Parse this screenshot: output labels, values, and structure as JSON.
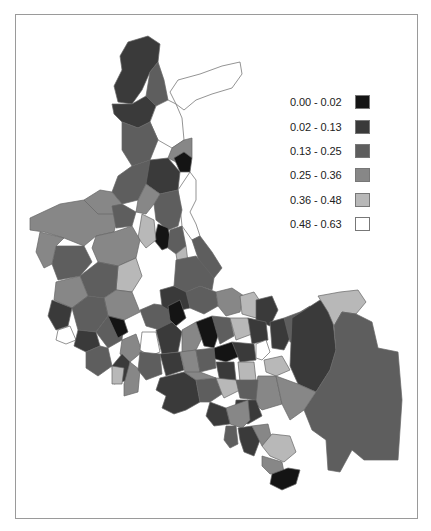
{
  "map": {
    "title": "",
    "stroke_color": "#666666",
    "classes": [
      {
        "label": "0.00 - 0.02",
        "color": "#141414"
      },
      {
        "label": "0.02 - 0.13",
        "color": "#3a3a3a"
      },
      {
        "label": "0.13 - 0.25",
        "color": "#5e5e5e"
      },
      {
        "label": "0.25 - 0.36",
        "color": "#878787"
      },
      {
        "label": "0.36 - 0.48",
        "color": "#b8b8b8"
      },
      {
        "label": "0.48 - 0.63",
        "color": "#ffffff"
      }
    ],
    "legend": {
      "position": "top-right",
      "items": [
        {
          "label": "0.00 - 0.02"
        },
        {
          "label": "0.02 - 0.13"
        },
        {
          "label": "0.13 - 0.25"
        },
        {
          "label": "0.25 - 0.36"
        },
        {
          "label": "0.36 - 0.48"
        },
        {
          "label": "0.48 - 0.63"
        }
      ]
    },
    "regions": [
      {
        "c": 1,
        "p": "128,42 148,36 160,44 158,62 150,72 142,90 132,104 118,102 114,86 122,70 120,56"
      },
      {
        "c": 2,
        "p": "150,72 158,62 164,80 168,100 156,106 146,96"
      },
      {
        "c": 5,
        "p": "170,92 178,80 200,74 222,66 240,62 242,74 232,88 212,94 196,100 184,110 176,104"
      },
      {
        "c": 1,
        "p": "112,104 132,104 146,96 156,106 150,122 138,128 122,122 114,114"
      },
      {
        "c": 5,
        "p": "150,122 156,106 168,100 176,104 182,118 184,140 172,148 158,140"
      },
      {
        "c": 2,
        "p": "122,122 138,128 150,122 158,140 150,160 132,166 122,150"
      },
      {
        "c": 3,
        "p": "172,148 184,140 192,138 192,158 180,164 168,158"
      },
      {
        "c": 0,
        "p": "174,158 184,152 192,158 190,172 180,172"
      },
      {
        "c": 1,
        "p": "150,160 168,158 180,172 178,190 160,194 146,184 140,170"
      },
      {
        "c": 2,
        "p": "132,166 150,160 146,184 138,200 122,204 112,192 118,176"
      },
      {
        "c": 5,
        "p": "190,172 196,180 196,200 190,212 196,224 200,236 192,240 182,226 180,206 178,190"
      },
      {
        "c": 2,
        "p": "160,194 178,190 182,210 178,226 168,230 156,220 154,204"
      },
      {
        "c": 3,
        "p": "146,184 160,194 154,204 146,214 136,212 138,200"
      },
      {
        "c": 0,
        "p": "158,224 168,228 172,246 162,250 154,240"
      },
      {
        "c": 4,
        "p": "142,214 154,220 156,240 146,248 138,238"
      },
      {
        "c": 2,
        "p": "170,230 182,226 186,246 176,254 168,248"
      },
      {
        "c": 4,
        "p": "176,254 186,246 188,262 178,266"
      },
      {
        "c": 2,
        "p": "192,240 200,236 212,252 222,268 214,278 200,264"
      },
      {
        "c": 3,
        "p": "30,218 60,204 84,200 96,208 112,206 118,216 114,232 96,236 84,246 64,238 44,232 30,230"
      },
      {
        "c": 3,
        "p": "84,200 100,190 112,192 122,204 114,214 98,214"
      },
      {
        "c": 2,
        "p": "112,206 122,204 136,212 132,226 116,228"
      },
      {
        "c": 3,
        "p": "96,236 114,232 132,226 140,240 136,258 118,266 98,262 92,248"
      },
      {
        "c": 2,
        "p": "56,246 84,246 92,262 80,276 58,280 52,264"
      },
      {
        "c": 3,
        "p": "40,232 64,238 56,246 52,264 44,268 36,252"
      },
      {
        "c": 4,
        "p": "118,266 136,258 142,276 132,292 116,290"
      },
      {
        "c": 2,
        "p": "80,276 98,262 118,266 116,290 104,298 88,296"
      },
      {
        "c": 3,
        "p": "56,282 80,276 88,296 72,308 54,300"
      },
      {
        "c": 1,
        "p": "52,300 72,308 68,326 56,330 48,316"
      },
      {
        "c": 3,
        "p": "104,298 116,290 132,292 140,312 124,320 108,316"
      },
      {
        "c": 2,
        "p": "72,308 88,296 104,298 108,316 96,332 78,330"
      },
      {
        "c": 5,
        "p": "58,330 70,326 76,340 66,344 56,340"
      },
      {
        "c": 1,
        "p": "78,330 96,332 100,346 86,352 74,346"
      },
      {
        "c": 2,
        "p": "96,332 108,316 124,320 122,340 108,348"
      },
      {
        "c": 0,
        "p": "108,316 124,320 128,332 118,338"
      },
      {
        "c": 3,
        "p": "122,340 136,334 142,352 130,362 120,354"
      },
      {
        "c": 2,
        "p": "86,352 100,346 108,348 112,366 98,376 86,368"
      },
      {
        "c": 1,
        "p": "112,366 122,354 130,362 128,380 114,384"
      },
      {
        "c": 3,
        "p": "124,384 130,362 140,370 138,392 124,396"
      },
      {
        "c": 4,
        "p": "112,366 124,368 122,384 112,384"
      },
      {
        "c": 2,
        "p": "140,310 154,304 168,306 172,322 160,330 146,326"
      },
      {
        "c": 1,
        "p": "160,290 174,286 188,292 190,308 172,312 162,306"
      },
      {
        "c": 0,
        "p": "168,306 180,300 186,318 176,326 170,320"
      },
      {
        "c": 2,
        "p": "186,292 200,286 216,292 218,306 204,314 190,308"
      },
      {
        "c": 3,
        "p": "216,292 232,288 244,296 240,312 226,316 218,306"
      },
      {
        "c": 4,
        "p": "240,296 254,292 262,304 256,318 242,314"
      },
      {
        "c": 1,
        "p": "256,300 272,296 278,310 270,326 256,320"
      },
      {
        "c": 5,
        "p": "142,332 156,332 160,352 150,356 140,350"
      },
      {
        "c": 1,
        "p": "156,330 172,322 182,332 178,352 162,354"
      },
      {
        "c": 3,
        "p": "182,330 196,322 204,334 196,350 182,352"
      },
      {
        "c": 0,
        "p": "196,322 212,316 220,330 214,348 204,346"
      },
      {
        "c": 2,
        "p": "212,316 230,318 234,336 220,344"
      },
      {
        "c": 4,
        "p": "230,318 248,318 252,334 236,340"
      },
      {
        "c": 1,
        "p": "248,318 266,322 268,340 252,344"
      },
      {
        "c": 0,
        "p": "214,348 232,342 240,356 226,362 212,358"
      },
      {
        "c": 1,
        "p": "232,342 254,344 256,360 240,362"
      },
      {
        "c": 5,
        "p": "256,344 266,340 270,352 262,360 256,358"
      },
      {
        "c": 2,
        "p": "140,352 160,354 162,374 146,380 138,370"
      },
      {
        "c": 1,
        "p": "160,354 180,352 184,370 166,376"
      },
      {
        "c": 3,
        "p": "180,352 196,350 200,372 186,376"
      },
      {
        "c": 2,
        "p": "196,350 214,348 216,368 200,372"
      },
      {
        "c": 1,
        "p": "216,362 234,362 236,380 220,382"
      },
      {
        "c": 4,
        "p": "238,362 254,362 256,380 240,382"
      },
      {
        "c": 1,
        "p": "270,322 284,318 292,334 284,350 272,348"
      },
      {
        "c": 2,
        "p": "284,318 300,312 308,326 300,342 290,342"
      },
      {
        "c": 3,
        "p": "300,312 310,306 318,320 312,340 304,342"
      },
      {
        "c": 4,
        "p": "264,360 282,356 290,370 276,376 266,372"
      },
      {
        "c": 3,
        "p": "258,376 276,376 282,404 262,410 252,400"
      },
      {
        "c": 1,
        "p": "160,378 184,372 196,380 200,402 186,410 174,414 162,408 166,396 156,390"
      },
      {
        "c": 2,
        "p": "196,380 216,378 222,394 210,402 200,402"
      },
      {
        "c": 3,
        "p": "184,372 200,372 216,378 196,380"
      },
      {
        "c": 4,
        "p": "216,378 236,380 240,390 224,398 222,394"
      },
      {
        "c": 2,
        "p": "236,380 258,380 256,400 240,398"
      },
      {
        "c": 1,
        "p": "236,400 256,400 262,416 248,424 234,418"
      },
      {
        "c": 3,
        "p": "226,408 248,400 250,420 242,428 230,424"
      },
      {
        "c": 1,
        "p": "210,402 226,408 230,424 214,426 206,416"
      },
      {
        "c": 2,
        "p": "226,426 236,426 238,444 230,448 224,440"
      },
      {
        "c": 1,
        "p": "238,428 252,426 260,440 254,456 244,452 240,440"
      },
      {
        "c": 3,
        "p": "252,426 268,424 272,440 262,446"
      },
      {
        "c": 4,
        "p": "272,434 290,436 296,452 284,462 270,456 262,446"
      },
      {
        "c": 3,
        "p": "262,456 282,462 284,472 270,474 262,466"
      },
      {
        "c": 0,
        "p": "272,474 288,468 300,470 296,484 282,490 270,484"
      },
      {
        "c": 1,
        "p": "292,318 320,300 332,312 336,350 330,370 316,392 298,384 290,366"
      },
      {
        "c": 4,
        "p": "318,296 340,292 358,290 366,302 356,314 342,312 334,326 328,312"
      },
      {
        "c": 2,
        "p": "356,314 372,322 378,348 398,352 402,400 398,460 364,460 352,450 340,472 328,470 326,440 312,430 304,410 316,392 330,370 336,350 334,326 342,312"
      },
      {
        "c": 3,
        "p": "276,376 298,384 316,392 304,410 290,420 282,404"
      },
      {
        "c": 2,
        "p": "176,260 196,256 214,278 212,290 200,286 186,292 174,286"
      }
    ]
  }
}
